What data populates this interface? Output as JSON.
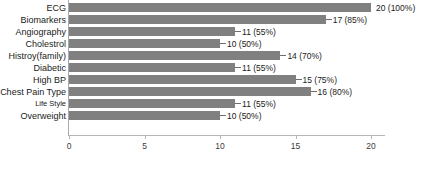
{
  "chart_data": {
    "type": "bar",
    "orientation": "horizontal",
    "title": "",
    "xlabel": "",
    "ylabel": "",
    "xlim": [
      0,
      20
    ],
    "grid": false,
    "legend": null,
    "bar_color": "#808080",
    "axis_color": "#b5b5b5",
    "xticks": [
      0,
      5,
      10,
      15,
      20
    ],
    "xtick_labels": [
      "0",
      "5",
      "10",
      "15",
      "20"
    ],
    "categories": [
      "ECG",
      "Biomarkers",
      "Angiography",
      "Cholestrol",
      "Histroy(family)",
      "Diabetic",
      "High BP",
      "Chest Pain Type",
      "Life Style",
      "Overweight"
    ],
    "values": [
      20,
      17,
      11,
      10,
      14,
      11,
      15,
      16,
      11,
      10
    ],
    "percentages": [
      "100%",
      "85%",
      "55%",
      "50%",
      "70%",
      "55%",
      "75%",
      "80%",
      "55%",
      "50%"
    ],
    "data_labels": [
      "20 (100%)",
      "17 (85%)",
      "11 (55%)",
      "10 (50%)",
      "14 (70%)",
      "11 (55%)",
      "15 (75%)",
      "16 (80%)",
      "11 (55%)",
      "10 (50%)"
    ]
  }
}
